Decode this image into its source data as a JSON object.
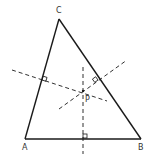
{
  "diagram": {
    "type": "triangle-perpendicular-bisectors",
    "vertices": {
      "A": {
        "label": "A",
        "x": 25,
        "y": 139
      },
      "B": {
        "label": "B",
        "x": 141,
        "y": 139
      },
      "C": {
        "label": "C",
        "x": 59,
        "y": 19
      }
    },
    "intersection": {
      "label": "P",
      "x": 83,
      "y": 91
    },
    "bisectors": [
      {
        "name": "bisector-AB",
        "x1": 83,
        "y1": 67,
        "x2": 83,
        "y2": 154
      },
      {
        "name": "bisector-AC",
        "x1": 12,
        "y1": 70,
        "x2": 107,
        "y2": 101
      },
      {
        "name": "bisector-BC",
        "x1": 59,
        "y1": 109,
        "x2": 127,
        "y2": 60
      }
    ],
    "colors": {
      "stroke": "#1a1a1a",
      "label": "#333333",
      "background": "#ffffff"
    }
  }
}
